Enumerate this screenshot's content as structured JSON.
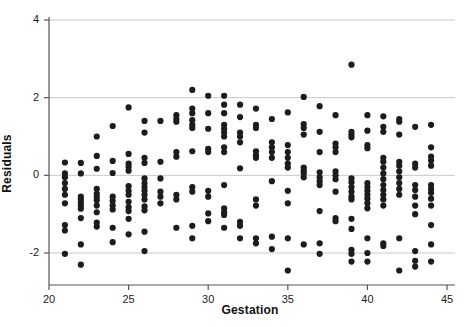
{
  "chart_data": {
    "type": "scatter",
    "title": "",
    "xlabel": "Gestation",
    "ylabel": "Residuals",
    "xlim": [
      19.3,
      45.6
    ],
    "ylim": [
      -2.85,
      4.3
    ],
    "xticks": [
      20,
      25,
      30,
      35,
      40,
      45
    ],
    "xtick_labels": [
      "20",
      "25",
      "30",
      "35",
      "40",
      "45"
    ],
    "yticks": [
      -2,
      0,
      2,
      4
    ],
    "ytick_labels": [
      "-2",
      "0",
      "2",
      "4"
    ],
    "grid": "horizontal",
    "gridlines_at": [
      -2,
      0,
      2,
      4
    ],
    "legend": "none",
    "marker": {
      "shape": "circle",
      "color": "#1c1c1c",
      "size_px": 5
    },
    "points": [
      [
        21,
        0.33
      ],
      [
        21,
        0.05
      ],
      [
        21,
        -0.05
      ],
      [
        21,
        -0.2
      ],
      [
        21,
        -0.35
      ],
      [
        21,
        -0.5
      ],
      [
        21,
        -0.72
      ],
      [
        21,
        -1.28
      ],
      [
        21,
        -1.42
      ],
      [
        21,
        -2.02
      ],
      [
        22,
        0.32
      ],
      [
        22,
        0.05
      ],
      [
        22,
        -0.55
      ],
      [
        22,
        -0.62
      ],
      [
        22,
        -0.7
      ],
      [
        22,
        -0.78
      ],
      [
        22,
        -0.86
      ],
      [
        22,
        -1.1
      ],
      [
        22,
        -1.78
      ],
      [
        22,
        -2.3
      ],
      [
        23,
        1.0
      ],
      [
        23,
        0.5
      ],
      [
        23,
        0.17
      ],
      [
        23,
        -0.35
      ],
      [
        23,
        -0.48
      ],
      [
        23,
        -0.56
      ],
      [
        23,
        -0.64
      ],
      [
        23,
        -0.78
      ],
      [
        23,
        -0.95
      ],
      [
        23,
        -1.22
      ],
      [
        23,
        -1.32
      ],
      [
        24,
        1.27
      ],
      [
        24,
        0.37
      ],
      [
        24,
        0.06
      ],
      [
        24,
        -0.55
      ],
      [
        24,
        -0.66
      ],
      [
        24,
        -0.78
      ],
      [
        24,
        -0.88
      ],
      [
        24,
        -1.35
      ],
      [
        24,
        -1.72
      ],
      [
        25,
        1.75
      ],
      [
        25,
        0.55
      ],
      [
        25,
        0.3
      ],
      [
        25,
        0.22
      ],
      [
        25,
        0.12
      ],
      [
        25,
        -0.28
      ],
      [
        25,
        -0.4
      ],
      [
        25,
        -0.5
      ],
      [
        25,
        -0.68
      ],
      [
        25,
        -0.82
      ],
      [
        25,
        -0.92
      ],
      [
        25,
        -1.12
      ],
      [
        25,
        -1.52
      ],
      [
        26,
        1.4
      ],
      [
        26,
        1.1
      ],
      [
        26,
        0.45
      ],
      [
        26,
        0.32
      ],
      [
        26,
        -0.08
      ],
      [
        26,
        -0.2
      ],
      [
        26,
        -0.3
      ],
      [
        26,
        -0.4
      ],
      [
        26,
        -0.5
      ],
      [
        26,
        -0.62
      ],
      [
        26,
        -0.8
      ],
      [
        26,
        -0.9
      ],
      [
        26,
        -1.45
      ],
      [
        26,
        -1.95
      ],
      [
        27,
        1.4
      ],
      [
        27,
        0.35
      ],
      [
        27,
        -0.08
      ],
      [
        27,
        -0.42
      ],
      [
        27,
        -0.55
      ],
      [
        27,
        -0.72
      ],
      [
        28,
        1.55
      ],
      [
        28,
        1.45
      ],
      [
        28,
        1.38
      ],
      [
        28,
        0.6
      ],
      [
        28,
        0.48
      ],
      [
        28,
        -0.5
      ],
      [
        28,
        -0.62
      ],
      [
        28,
        -1.35
      ],
      [
        29,
        2.2
      ],
      [
        29,
        1.72
      ],
      [
        29,
        1.6
      ],
      [
        29,
        1.42
      ],
      [
        29,
        1.3
      ],
      [
        29,
        1.22
      ],
      [
        29,
        0.62
      ],
      [
        29,
        -0.3
      ],
      [
        29,
        -0.42
      ],
      [
        29,
        -1.3
      ],
      [
        29,
        -1.62
      ],
      [
        30,
        2.05
      ],
      [
        30,
        1.6
      ],
      [
        30,
        1.2
      ],
      [
        30,
        0.68
      ],
      [
        30,
        0.6
      ],
      [
        30,
        -0.4
      ],
      [
        30,
        -0.55
      ],
      [
        30,
        -0.98
      ],
      [
        30,
        -1.18
      ],
      [
        31,
        2.05
      ],
      [
        31,
        1.82
      ],
      [
        31,
        1.6
      ],
      [
        31,
        1.3
      ],
      [
        31,
        1.2
      ],
      [
        31,
        1.1
      ],
      [
        31,
        1.0
      ],
      [
        31,
        0.72
      ],
      [
        31,
        0.6
      ],
      [
        31,
        -0.25
      ],
      [
        31,
        -0.85
      ],
      [
        31,
        -0.95
      ],
      [
        31,
        -1.02
      ],
      [
        31,
        -1.35
      ],
      [
        32,
        1.82
      ],
      [
        32,
        1.5
      ],
      [
        32,
        1.1
      ],
      [
        32,
        1.0
      ],
      [
        32,
        0.85
      ],
      [
        32,
        0.18
      ],
      [
        32,
        -1.2
      ],
      [
        32,
        -1.3
      ],
      [
        32,
        -1.62
      ],
      [
        33,
        1.72
      ],
      [
        33,
        1.3
      ],
      [
        33,
        1.22
      ],
      [
        33,
        0.62
      ],
      [
        33,
        0.52
      ],
      [
        33,
        0.45
      ],
      [
        33,
        -0.62
      ],
      [
        33,
        -0.78
      ],
      [
        33,
        -1.62
      ],
      [
        33,
        -1.75
      ],
      [
        34,
        1.45
      ],
      [
        34,
        0.85
      ],
      [
        34,
        0.72
      ],
      [
        34,
        0.6
      ],
      [
        34,
        0.45
      ],
      [
        34,
        -0.15
      ],
      [
        34,
        -1.58
      ],
      [
        34,
        -1.9
      ],
      [
        35,
        1.62
      ],
      [
        35,
        0.78
      ],
      [
        35,
        0.6
      ],
      [
        35,
        0.45
      ],
      [
        35,
        0.3
      ],
      [
        35,
        0.2
      ],
      [
        35,
        -0.4
      ],
      [
        35,
        -0.72
      ],
      [
        35,
        -1.62
      ],
      [
        35,
        -2.45
      ],
      [
        36,
        2.02
      ],
      [
        36,
        1.32
      ],
      [
        36,
        1.22
      ],
      [
        36,
        1.05
      ],
      [
        36,
        0.2
      ],
      [
        36,
        0.12
      ],
      [
        36,
        0.05
      ],
      [
        36,
        -0.05
      ],
      [
        36,
        -1.78
      ],
      [
        37,
        1.78
      ],
      [
        37,
        1.12
      ],
      [
        37,
        0.6
      ],
      [
        37,
        0.08
      ],
      [
        37,
        -0.05
      ],
      [
        37,
        -0.15
      ],
      [
        37,
        -0.25
      ],
      [
        37,
        -0.92
      ],
      [
        37,
        -1.75
      ],
      [
        37,
        -2.02
      ],
      [
        38,
        1.55
      ],
      [
        38,
        0.82
      ],
      [
        38,
        0.72
      ],
      [
        38,
        0.6
      ],
      [
        38,
        0.1
      ],
      [
        38,
        0.0
      ],
      [
        38,
        -0.1
      ],
      [
        38,
        -0.42
      ],
      [
        38,
        -1.1
      ],
      [
        38,
        -1.18
      ],
      [
        39,
        2.85
      ],
      [
        39,
        1.12
      ],
      [
        39,
        1.05
      ],
      [
        39,
        0.98
      ],
      [
        39,
        -0.08
      ],
      [
        39,
        -0.18
      ],
      [
        39,
        -0.3
      ],
      [
        39,
        -0.42
      ],
      [
        39,
        -0.55
      ],
      [
        39,
        -0.62
      ],
      [
        39,
        -1.12
      ],
      [
        39,
        -1.38
      ],
      [
        39,
        -1.92
      ],
      [
        39,
        -2.02
      ],
      [
        39,
        -2.22
      ],
      [
        40,
        1.55
      ],
      [
        40,
        1.15
      ],
      [
        40,
        0.78
      ],
      [
        40,
        0.7
      ],
      [
        40,
        -0.2
      ],
      [
        40,
        -0.3
      ],
      [
        40,
        -0.4
      ],
      [
        40,
        -0.5
      ],
      [
        40,
        -0.6
      ],
      [
        40,
        -0.72
      ],
      [
        40,
        -0.85
      ],
      [
        40,
        -1.62
      ],
      [
        40,
        -2.0
      ],
      [
        40,
        -2.22
      ],
      [
        41,
        1.52
      ],
      [
        41,
        1.25
      ],
      [
        41,
        1.12
      ],
      [
        41,
        0.45
      ],
      [
        41,
        0.35
      ],
      [
        41,
        0.2
      ],
      [
        41,
        0.05
      ],
      [
        41,
        -0.1
      ],
      [
        41,
        -0.25
      ],
      [
        41,
        -0.38
      ],
      [
        41,
        -0.5
      ],
      [
        41,
        -0.62
      ],
      [
        41,
        -0.78
      ],
      [
        41,
        -1.75
      ],
      [
        41,
        -1.82
      ],
      [
        42,
        1.45
      ],
      [
        42,
        1.38
      ],
      [
        42,
        1.05
      ],
      [
        42,
        0.35
      ],
      [
        42,
        0.25
      ],
      [
        42,
        0.1
      ],
      [
        42,
        -0.05
      ],
      [
        42,
        -0.2
      ],
      [
        42,
        -0.35
      ],
      [
        42,
        -0.5
      ],
      [
        42,
        -1.62
      ],
      [
        42,
        -2.45
      ],
      [
        43,
        1.25
      ],
      [
        43,
        0.3
      ],
      [
        43,
        0.2
      ],
      [
        43,
        -0.25
      ],
      [
        43,
        -0.38
      ],
      [
        43,
        -0.55
      ],
      [
        43,
        -0.78
      ],
      [
        43,
        -1.0
      ],
      [
        43,
        -1.95
      ],
      [
        43,
        -2.2
      ],
      [
        43,
        -2.35
      ],
      [
        44,
        1.3
      ],
      [
        44,
        0.72
      ],
      [
        44,
        0.48
      ],
      [
        44,
        0.38
      ],
      [
        44,
        0.25
      ],
      [
        44,
        -0.25
      ],
      [
        44,
        -0.35
      ],
      [
        44,
        -0.45
      ],
      [
        44,
        -0.6
      ],
      [
        44,
        -0.78
      ],
      [
        44,
        -1.28
      ],
      [
        44,
        -1.78
      ],
      [
        44,
        -2.22
      ]
    ]
  },
  "colors": {
    "marker": "#1c1c1c",
    "gridline": "#c8c8c8",
    "axis": "#555555",
    "text": "#111111",
    "background": "#ffffff"
  }
}
